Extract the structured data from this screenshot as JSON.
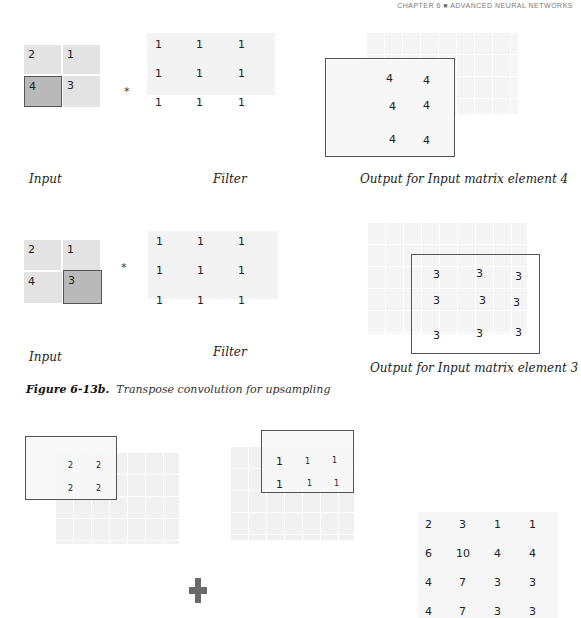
{
  "header": {
    "running_head": "CHAPTER 6 ■ ADVANCED NEURAL NETWORKS"
  },
  "panel1": {
    "input": {
      "cells": [
        "2",
        "1",
        "4",
        "3"
      ],
      "highlighted_index": 2,
      "label": "Input"
    },
    "operator": "*",
    "filter": {
      "cells": [
        "1",
        "1",
        "1",
        "1",
        "1",
        "1",
        "1",
        "1",
        "1"
      ],
      "label": "Filter"
    },
    "output": {
      "values": [
        "4",
        "4",
        "4",
        "4",
        "4",
        "4"
      ],
      "label": "Output for Input matrix element 4"
    }
  },
  "panel2": {
    "input": {
      "cells": [
        "2",
        "1",
        "4",
        "3"
      ],
      "highlighted_index": 3,
      "label": "Input"
    },
    "operator": "*",
    "filter": {
      "cells": [
        "1",
        "1",
        "1",
        "1",
        "1",
        "1",
        "1",
        "1",
        "1"
      ],
      "label": "Filter"
    },
    "output": {
      "values": [
        "3",
        "3",
        "3",
        "3",
        "3",
        "3",
        "3",
        "3",
        "3"
      ],
      "label": "Output for Input matrix element 3"
    }
  },
  "caption": {
    "figure_label": "Figure 6-13b.",
    "text": "Transpose convolution for upsampling"
  },
  "panel3": {
    "left_overlay": {
      "values": [
        "2",
        "2",
        "2",
        "2"
      ]
    },
    "mid_overlay": {
      "values": [
        "1",
        "1",
        "1",
        "1",
        "1",
        "1"
      ]
    },
    "plus_symbol": "+",
    "result": {
      "rows": [
        [
          "2",
          "3",
          "1",
          "1"
        ],
        [
          "6",
          "10",
          "4",
          "4"
        ],
        [
          "4",
          "7",
          "3",
          "3"
        ],
        [
          "4",
          "7",
          "3",
          "3"
        ]
      ]
    }
  }
}
